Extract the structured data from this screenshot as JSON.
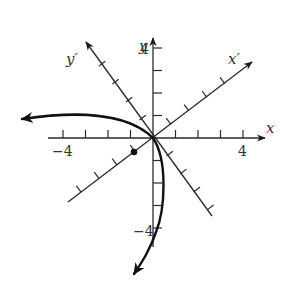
{
  "figure": {
    "type": "rotated-axes-parabola",
    "axes": {
      "x_label": "x",
      "y_label": "y",
      "x_prime_label": "x′",
      "y_prime_label": "y′",
      "x_tick_labels": [
        "−4",
        "4"
      ],
      "y_tick_labels": [
        "4",
        "−4"
      ],
      "x_range": [
        -4.5,
        5
      ],
      "y_range": [
        -4.5,
        4.5
      ],
      "tick_step": 1,
      "rotation_angle_deg": 37
    },
    "curve": {
      "kind": "parabola",
      "vertex_in_rotated_coords": "origin",
      "opens": "toward -y′ direction (lower-left), both ends arrowed",
      "left_end": [
        -6,
        0.9
      ],
      "right_end": [
        -0.9,
        -6
      ]
    },
    "marked_point": {
      "label": "focus",
      "xy": [
        -0.85,
        -0.65
      ]
    },
    "colors": {
      "axes": "#2a2a2a",
      "curve": "#111111",
      "text": "#333333"
    }
  }
}
